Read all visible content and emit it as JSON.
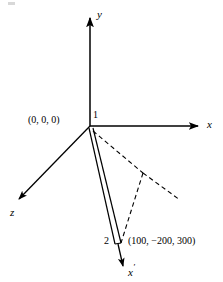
{
  "figure": {
    "kind": "3d-axes-member-diagram",
    "background_color": "#ffffff",
    "stroke_color": "#000000",
    "width": 223,
    "height": 282,
    "axes": [
      {
        "name": "y-axis",
        "label": "y",
        "label_x": 97,
        "label_y": 9,
        "from": [
          90,
          126
        ],
        "to": [
          90,
          18
        ],
        "style": "solid",
        "arrow": true
      },
      {
        "name": "x-axis",
        "label": "x",
        "label_x": 207,
        "label_y": 120,
        "from": [
          90,
          126
        ],
        "to": [
          198,
          126
        ],
        "style": "solid",
        "arrow": true
      },
      {
        "name": "z-axis",
        "label": "z",
        "label_x": 10,
        "label_y": 208,
        "from": [
          90,
          126
        ],
        "to": [
          17,
          201
        ],
        "style": "solid",
        "arrow": true
      },
      {
        "name": "x-prime-axis",
        "label": "x",
        "label_prime": "′",
        "label_x": 128,
        "label_y": 264,
        "from": [
          119,
          243
        ],
        "to": [
          123,
          268
        ],
        "style": "solid",
        "arrow": true
      }
    ],
    "member": {
      "name": "member-1-2",
      "from": [
        90,
        127
      ],
      "to": [
        119,
        243
      ],
      "style": "double-solid-line",
      "offset_px": 4
    },
    "dashed_lines": [
      {
        "name": "dashed-origin-to-vertex",
        "from": [
          92,
          131
        ],
        "to": [
          143,
          173
        ]
      },
      {
        "name": "dashed-vertex-to-lower-right",
        "from": [
          143,
          173
        ],
        "to": [
          180,
          200
        ]
      },
      {
        "name": "dashed-vertex-to-node-2",
        "from": [
          143,
          173
        ],
        "to": [
          120,
          243
        ]
      }
    ],
    "nodes": [
      {
        "name": "node-1",
        "label": "1",
        "label_x": 93,
        "label_y": 112,
        "point": [
          90,
          126
        ],
        "coordinate_label": "(0, 0, 0)",
        "coordinate_label_x": 28,
        "coordinate_label_y": 116
      },
      {
        "name": "node-2",
        "label": "2",
        "label_x": 105,
        "label_y": 236,
        "point": [
          119,
          243
        ],
        "coordinate_label": "(100, −200, 300)",
        "coordinate_label_x": 128,
        "coordinate_label_y": 236
      }
    ]
  }
}
